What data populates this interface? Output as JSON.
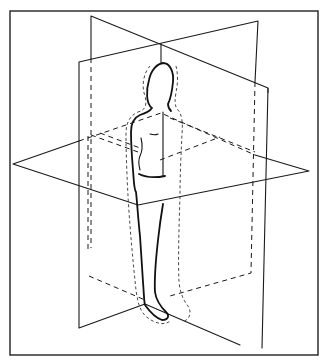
{
  "diagram": {
    "colors": {
      "line": "#1a1a1a",
      "background": "#ffffff"
    },
    "frame": {
      "x": 10,
      "y": 11,
      "width": 308,
      "height": 344
    },
    "planes": {
      "sagittal": {
        "solid": "M91,16 L268,88 L262,348 M91,16 L91,58",
        "hidden": "M91,58 L91,248 M268,88 L268,95"
      },
      "coronal": {
        "solid": "M79,62 L258,21 L255,82 M79,62 L79,328 L145,304 M145,304 L240,345",
        "hidden": "M255,82 L251,273 L170,296 M79,62 L79,62"
      },
      "transverse": {
        "solid": "M13,164 L79,141 M13,164 L138,205 L309,171 L255,155 M79,141 L79,141",
        "hidden": "M79,141 L161,113 L255,155 M91,135 L138,152"
      },
      "axis": {
        "solid": "M161,44 L161,64",
        "hidden": ""
      },
      "hidden_extra": "M89,276 L145,300 M88,136 L88,252 M170,118 L255,152 M100,133 L140,148 M160,160 L220,137"
    },
    "figure": {
      "body": "M152,108 C146,104 146,90 149,80 C151,70 157,64 163,63 C170,63 174,72 173,82 C172,92 170,100 168,104 C168,108 170,110 171,111 M152,108 C150,111 146,113 140,115 C133,118 131,124 131,132 C131,145 132,158 133,170 C134,182 134,190 136,192 M136,192 C137,200 138,218 140,236 C141,252 142,268 143,282 C144,294 144,302 145,305 M145,305 C150,312 156,318 162,320 C168,320 170,316 166,312 C160,306 156,300 155,292 C154,276 156,258 158,240 C160,222 162,210 163,204",
      "torso_front": "M139,174 C145,177 155,178 165,176",
      "arm_detail": "M141,138 C143,146 142,152 140,156 C138,160 139,166 140,170",
      "chest_mark": "M150,134 C153,135 156,135 158,134",
      "midline": "M163,112 L163,176",
      "outline": "M150,66 C144,72 141,86 145,96 C147,104 146,110 138,112 C129,116 126,124 126,134 C126,154 127,176 128,196 C130,230 133,262 136,290 C138,304 140,312 148,318 C156,324 166,326 171,320 M176,66 C178,74 178,84 176,92 C175,100 174,106 178,110 C182,114 183,124 182,134 C181,154 180,176 180,196 C179,226 178,258 179,282 C180,292 183,300 188,306 C192,312 190,320 182,322"
    }
  }
}
